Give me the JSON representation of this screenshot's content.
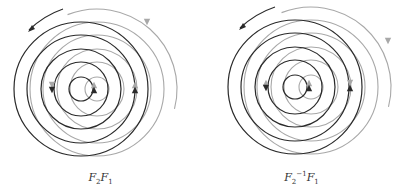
{
  "figures": [
    {
      "id": "left",
      "caption": {
        "base1": "F",
        "sub1": "2",
        "sup1": "",
        "base2": "F",
        "sub2": "1"
      },
      "black_center": [
        81,
        89
      ],
      "gray_center": [
        97,
        89
      ],
      "radii": [
        12,
        27,
        40,
        54,
        67
      ],
      "outer_gray_arc_radius": 80,
      "outer_black_arrow": {
        "from": [
          63,
          9
        ],
        "to": [
          29,
          30
        ]
      },
      "gray_arrow_tip": [
        147,
        22
      ],
      "markers": [
        {
          "x": 52,
          "y": 89,
          "black": "down",
          "gray": "down"
        },
        {
          "x": 94,
          "y": 89,
          "black": "up",
          "gray": "up"
        },
        {
          "x": 135,
          "y": 89,
          "black": "up",
          "gray": "up"
        }
      ]
    },
    {
      "id": "right",
      "caption": {
        "base1": "F",
        "sub1": "2",
        "sup1": "−1",
        "base2": "F",
        "sub2": "1"
      },
      "black_center": [
        94,
        87
      ],
      "gray_center": [
        110,
        87
      ],
      "radii": [
        12,
        27,
        40,
        54,
        67
      ],
      "outer_gray_arc_radius": 80,
      "outer_black_arrow": {
        "from": [
          74,
          7
        ],
        "to": [
          39,
          28
        ]
      },
      "gray_arrow_tip": [
        187,
        41
      ],
      "markers": [
        {
          "x": 65,
          "y": 87,
          "black": "down",
          "gray": "up"
        },
        {
          "x": 108,
          "y": 87,
          "black": "up",
          "gray": "up"
        },
        {
          "x": 149,
          "y": 87,
          "black": "up",
          "gray": "down"
        }
      ]
    }
  ],
  "colors": {
    "black": "#2a2a2a",
    "gray": "#a8a8a8",
    "background": "#ffffff"
  }
}
